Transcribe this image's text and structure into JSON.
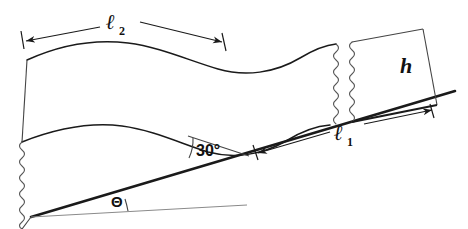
{
  "figure": {
    "type": "engineering-diagram",
    "background_color": "#ffffff",
    "line_color": "#1a1a1a",
    "thin_line_color": "#555555",
    "width": 468,
    "height": 229
  },
  "labels": {
    "l2": {
      "symbol": "ℓ",
      "subscript": "2",
      "name": "length-l2"
    },
    "l1": {
      "symbol": "ℓ",
      "subscript": "1",
      "name": "length-l1"
    },
    "h": {
      "symbol": "h",
      "name": "height-h"
    },
    "angle_30": {
      "value": "30",
      "unit": "°",
      "text": "30°"
    },
    "theta": {
      "symbol": "Θ",
      "name": "incline-angle-theta"
    }
  },
  "elements": {
    "incline_surface": "incline-surface-line",
    "horizontal_reference": "horizontal-reference-line",
    "curved_band": "curved-band-shape",
    "block_h": "right-block",
    "break_left": "wavy-break-left",
    "break_mid_a": "wavy-break-middle-a",
    "break_mid_b": "wavy-break-middle-b",
    "dimension_l2": "dimension-line-l2",
    "dimension_l1": "dimension-line-l1",
    "dimension_h": "dimension-line-h",
    "arc_30": "angle-arc-30",
    "arc_theta": "angle-arc-theta"
  }
}
